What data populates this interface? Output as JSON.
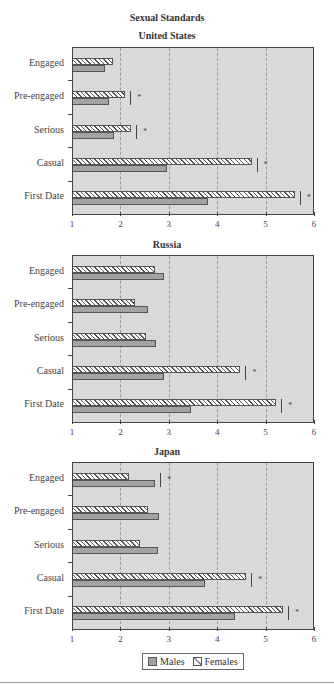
{
  "chart_data": {
    "type": "bar",
    "orientation": "horizontal",
    "title": "Sexual Standards",
    "categories": [
      "Engaged",
      "Pre-engaged",
      "Serious",
      "Casual",
      "First Date"
    ],
    "xlim": [
      1,
      6
    ],
    "xticks": [
      1,
      2,
      3,
      4,
      5,
      6
    ],
    "grid": "vertical dashed",
    "legend": {
      "position": "bottom",
      "entries": [
        "Males",
        "Females"
      ]
    },
    "panels": [
      {
        "title": "United States",
        "series": [
          {
            "name": "Females",
            "values": [
              1.84,
              2.1,
              2.22,
              4.71,
              5.6
            ]
          },
          {
            "name": "Males",
            "values": [
              1.68,
              1.76,
              1.86,
              2.96,
              3.8
            ]
          }
        ],
        "significant": [
          false,
          true,
          true,
          true,
          true
        ]
      },
      {
        "title": "Russia",
        "series": [
          {
            "name": "Females",
            "values": [
              2.71,
              2.3,
              2.53,
              4.48,
              5.22
            ]
          },
          {
            "name": "Males",
            "values": [
              2.9,
              2.56,
              2.73,
              2.9,
              3.45
            ]
          }
        ],
        "significant": [
          false,
          false,
          false,
          true,
          true
        ]
      },
      {
        "title": "Japan",
        "series": [
          {
            "name": "Females",
            "values": [
              2.18,
              2.56,
              2.41,
              4.6,
              5.36
            ]
          },
          {
            "name": "Males",
            "values": [
              2.72,
              2.8,
              2.77,
              3.74,
              4.36
            ]
          }
        ],
        "significant": [
          true,
          false,
          false,
          true,
          true
        ]
      }
    ]
  },
  "title": "Sexual Standards",
  "panels": [
    {
      "title": "United States"
    },
    {
      "title": "Russia"
    },
    {
      "title": "Japan"
    }
  ],
  "legend": {
    "males": "Males",
    "females": "Females"
  },
  "sig_marker": "*",
  "colors": {
    "plot_bg": "#d9d9d9",
    "male_bar": "#a3a3a3",
    "female_bar": "#ffffff",
    "axis": "#444444"
  }
}
